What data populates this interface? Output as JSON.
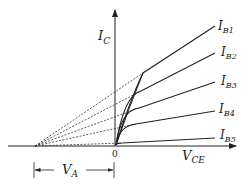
{
  "diagram": {
    "y_axis": {
      "label": "I",
      "label_sub": "C"
    },
    "x_axis": {
      "label": "V",
      "label_sub": "CE"
    },
    "origin_label": "0",
    "early_voltage": {
      "label": "V",
      "label_sub": "A"
    },
    "curves": [
      {
        "label": "I",
        "label_sub": "B1"
      },
      {
        "label": "I",
        "label_sub": "B2"
      },
      {
        "label": "I",
        "label_sub": "B3"
      },
      {
        "label": "I",
        "label_sub": "B4"
      },
      {
        "label": "I",
        "label_sub": "B5"
      }
    ],
    "colors": {
      "line": "#222222",
      "background": "#ffffff"
    }
  }
}
